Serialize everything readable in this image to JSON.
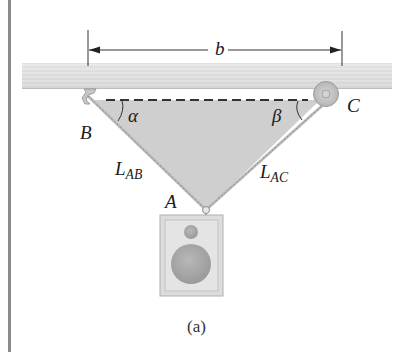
{
  "figure": {
    "caption": "(a)",
    "dimension_label": "b",
    "points": {
      "A": "A",
      "B": "B",
      "C": "C"
    },
    "angles": {
      "alpha": "α",
      "beta": "β"
    },
    "cables": {
      "ab_main": "L",
      "ab_sub": "AB",
      "ac_main": "L",
      "ac_sub": "AC"
    },
    "colors": {
      "ceiling": "#e2e2e2",
      "triangle_fill": "#cfcfcf",
      "border_bar": "#8a8a8a",
      "pulley": "#c8c8c8",
      "speaker_box": "#dcdcdc",
      "speaker_cone": "#a9a9a9"
    }
  }
}
